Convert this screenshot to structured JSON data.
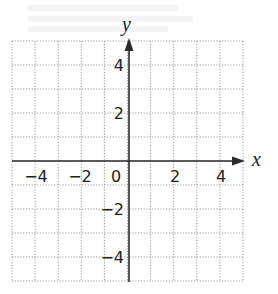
{
  "diagram": {
    "type": "coordinate-plane",
    "x_axis": {
      "label": "x",
      "min": -5,
      "max": 5,
      "grid_step": 1,
      "tick_labels": [
        -4,
        -2,
        2,
        4
      ]
    },
    "y_axis": {
      "label": "y",
      "min": -5,
      "max": 5,
      "grid_step": 1,
      "tick_labels": [
        4,
        2,
        -2,
        -4
      ]
    },
    "origin_label": "0",
    "grid": {
      "style": "dotted",
      "color": "#9a9a9a"
    },
    "axis_color": "#2b2b2b",
    "text_color": "#222222"
  },
  "labels": {
    "x": "x",
    "y": "y",
    "origin": "0",
    "x_ticks": {
      "m4": "−4",
      "m2": "−2",
      "p2": "2",
      "p4": "4"
    },
    "y_ticks": {
      "p4": "4",
      "p2": "2",
      "m2": "−2",
      "m4": "−4"
    }
  }
}
